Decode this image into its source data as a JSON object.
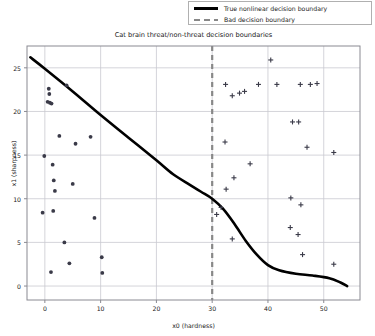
{
  "chart_data": {
    "type": "scatter",
    "title": "Cat brain threat/non-threat decision boundaries",
    "xlabel": "x0 (hardness)",
    "ylabel": "x1 (sharpness)",
    "xlim": [
      -3.2,
      56.5
    ],
    "ylim": [
      -1.6,
      27.5
    ],
    "grid": true,
    "xticks": [
      0,
      10,
      20,
      30,
      40,
      50
    ],
    "yticks": [
      0,
      5,
      10,
      15,
      20,
      25
    ],
    "legend": {
      "position": "upper right outside",
      "entries": [
        {
          "label": "True nonlinear decision boundary",
          "style": "solid",
          "color": "#000000"
        },
        {
          "label": "Bad decision boundary",
          "style": "dashed",
          "color": "#888888"
        }
      ]
    },
    "series": [
      {
        "name": "non-threat",
        "marker": "dot",
        "color": "#3a3a48",
        "points": [
          [
            0.7,
            22.6
          ],
          [
            0.8,
            22.0
          ],
          [
            0.5,
            21.1
          ],
          [
            0.9,
            21.0
          ],
          [
            1.2,
            20.9
          ],
          [
            3.9,
            23.0
          ],
          [
            2.6,
            17.2
          ],
          [
            5.5,
            16.3
          ],
          [
            8.2,
            17.1
          ],
          [
            -0.1,
            14.9
          ],
          [
            1.4,
            13.9
          ],
          [
            1.6,
            12.1
          ],
          [
            5.0,
            11.7
          ],
          [
            1.8,
            10.9
          ],
          [
            -0.4,
            8.4
          ],
          [
            1.5,
            8.6
          ],
          [
            8.9,
            7.8
          ],
          [
            3.5,
            5.0
          ],
          [
            10.2,
            3.3
          ],
          [
            4.4,
            2.6
          ],
          [
            1.1,
            1.6
          ],
          [
            10.3,
            1.5
          ]
        ]
      },
      {
        "name": "threat",
        "marker": "plus",
        "color": "#3a3a48",
        "points": [
          [
            40.5,
            25.9
          ],
          [
            32.4,
            23.1
          ],
          [
            35.8,
            22.3
          ],
          [
            38.3,
            23.1
          ],
          [
            41.6,
            23.1
          ],
          [
            45.8,
            23.1
          ],
          [
            47.6,
            23.1
          ],
          [
            48.8,
            23.2
          ],
          [
            33.6,
            21.8
          ],
          [
            34.9,
            22.1
          ],
          [
            44.4,
            18.8
          ],
          [
            45.5,
            18.8
          ],
          [
            32.3,
            16.5
          ],
          [
            47.0,
            15.9
          ],
          [
            51.8,
            15.3
          ],
          [
            36.8,
            14.0
          ],
          [
            33.9,
            12.4
          ],
          [
            32.5,
            11.1
          ],
          [
            44.1,
            10.1
          ],
          [
            45.9,
            9.3
          ],
          [
            30.8,
            8.2
          ],
          [
            31.6,
            9.0
          ],
          [
            44.0,
            6.7
          ],
          [
            45.4,
            5.9
          ],
          [
            33.6,
            5.4
          ],
          [
            46.2,
            3.6
          ],
          [
            51.8,
            2.5
          ]
        ]
      }
    ],
    "lines": [
      {
        "name": "True nonlinear decision boundary",
        "style": "solid",
        "color": "#000000",
        "points": [
          [
            -2.6,
            26.2
          ],
          [
            0.0,
            24.9
          ],
          [
            5.0,
            22.3
          ],
          [
            10.0,
            19.6
          ],
          [
            15.0,
            17.0
          ],
          [
            20.0,
            14.4
          ],
          [
            23.0,
            12.8
          ],
          [
            26.0,
            11.6
          ],
          [
            28.0,
            10.8
          ],
          [
            30.0,
            10.0
          ],
          [
            32.0,
            8.8
          ],
          [
            34.0,
            7.1
          ],
          [
            36.0,
            5.2
          ],
          [
            38.0,
            3.6
          ],
          [
            40.0,
            2.4
          ],
          [
            42.0,
            1.8
          ],
          [
            45.0,
            1.4
          ],
          [
            48.0,
            1.2
          ],
          [
            51.0,
            0.9
          ],
          [
            53.0,
            0.4
          ],
          [
            54.2,
            0.0
          ]
        ]
      },
      {
        "name": "Bad decision boundary",
        "style": "dashed",
        "color": "#888888",
        "vertical_x": 30.0
      }
    ]
  }
}
